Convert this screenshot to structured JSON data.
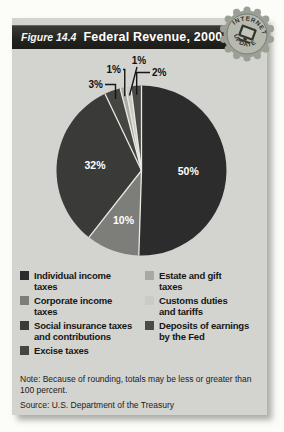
{
  "figure": {
    "label": "Figure 14.4",
    "title": "Federal Revenue, 2000"
  },
  "badge": {
    "top_text": "INTERNET",
    "bottom_text": "UPDATE",
    "icon": "computer-icon"
  },
  "chart_data": {
    "type": "pie",
    "title": "Federal Revenue, 2000",
    "direction": "clockwise",
    "start_angle_deg": 0,
    "legend_position": "below",
    "slices": [
      {
        "label": "Individual income taxes",
        "legend_label": "Individual income\ntaxes",
        "value_pct": 50,
        "display": "50%",
        "color": "#2c2c2c",
        "label_style": "inside"
      },
      {
        "label": "Corporate income taxes",
        "legend_label": "Corporate income\ntaxes",
        "value_pct": 10,
        "display": "10%",
        "color": "#7d7d79",
        "label_style": "inside"
      },
      {
        "label": "Social insurance taxes and contributions",
        "legend_label": "Social insurance taxes\nand contributions",
        "value_pct": 32,
        "display": "32%",
        "color": "#3a3a38",
        "label_style": "inside"
      },
      {
        "label": "Excise taxes",
        "legend_label": "Excise taxes",
        "value_pct": 3,
        "display": "3%",
        "color": "#454541",
        "label_style": "callout"
      },
      {
        "label": "Estate and gift taxes",
        "legend_label": "Estate and gift\ntaxes",
        "value_pct": 1,
        "display": "1%",
        "color": "#a9a9a3",
        "label_style": "callout"
      },
      {
        "label": "Customs duties and tariffs",
        "legend_label": "Customs duties\nand tariffs",
        "value_pct": 1,
        "display": "1%",
        "color": "#cbcbc5",
        "label_style": "callout"
      },
      {
        "label": "Deposits of earnings by the Fed",
        "legend_label": "Deposits of earnings\nby the Fed",
        "value_pct": 2,
        "display": "2%",
        "color": "#4a4a48",
        "label_style": "callout"
      }
    ],
    "colors": {
      "inside_label": "#ffffff",
      "callout_label": "#111111",
      "separator": "#eaeae4",
      "card_background": "#d3d3cf",
      "header_bar": "#23231f"
    }
  },
  "footer": {
    "note": "Note: Because of rounding, totals may be less or greater than 100 percent.",
    "source": "Source: U.S. Department of the Treasury"
  }
}
